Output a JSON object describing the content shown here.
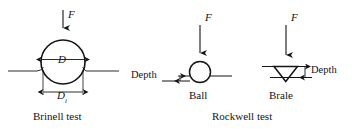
{
  "figure": {
    "title_brinell": "Brinell test",
    "title_rockwell": "Rockwell test",
    "ink_color": "#141414",
    "background_color": "#ffffff"
  },
  "brinell": {
    "force_label": "F",
    "diameter_label": "D",
    "indent_diameter_label": "D",
    "indent_diameter_subscript": "i",
    "caption": "Brinell test"
  },
  "rockwell_ball": {
    "force_label": "F",
    "depth_label": "Depth",
    "caption": "Ball"
  },
  "rockwell_brale": {
    "force_label": "F",
    "depth_label": "Depth",
    "caption": "Brale"
  },
  "group_caption": "Rockwell test"
}
